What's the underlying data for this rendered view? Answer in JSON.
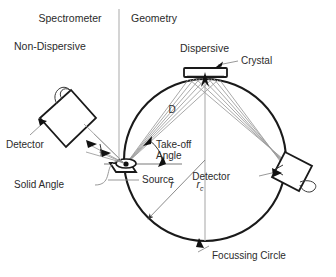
{
  "figure": {
    "title_line1": "Spectrometer",
    "title_line2": "Geometry",
    "mode_left": "Non-Dispersive",
    "mode_right": "Dispersive"
  },
  "labels": {
    "crystal": "Crystal",
    "detector_left": "Detector",
    "detector_right": "Detector",
    "solid_angle": "Solid Angle",
    "takeoff_line1": "Take-off",
    "takeoff_line2": "Angle",
    "source": "Source",
    "focussing_circle": "Focussing Circle",
    "distance_d": "D",
    "radius_r": "r",
    "radius_rc_base": "r",
    "radius_rc_sub": "c"
  },
  "colors": {
    "background": "#ffffff",
    "text": "#2b2b2b",
    "circle_stroke": "#1a1a1a",
    "ray_stroke": "#9a9a9a",
    "divider": "#c2c2c2",
    "axis": "#adadad"
  },
  "geometry": {
    "circle_center_x": 205,
    "circle_center_y": 160,
    "circle_radius": 81,
    "crystal_x": 205,
    "crystal_y": 78,
    "source_x": 126,
    "source_y": 164,
    "detector_right_x": 285,
    "detector_right_y": 172
  }
}
